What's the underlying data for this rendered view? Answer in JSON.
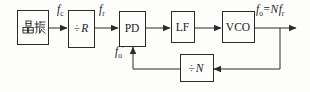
{
  "colors": {
    "background": "#fdfdfc",
    "line": "#2b2b2b",
    "text": "#1c1c1c"
  },
  "blocks": {
    "crystal": {
      "label": "晶振"
    },
    "divider_r": {
      "sign": "÷",
      "variable": "R"
    },
    "phase_detector": {
      "label": "PD"
    },
    "loop_filter": {
      "label": "LF"
    },
    "vco": {
      "label": "VCO"
    },
    "divider_n": {
      "sign": "÷",
      "variable": "N"
    }
  },
  "signals": {
    "crystal_out": {
      "base": "f",
      "sub": "c"
    },
    "reference": {
      "base": "f",
      "sub": "r"
    },
    "output": {
      "f1": "f",
      "sub1": "o",
      "eq": "=",
      "coef": "N",
      "f2": "f",
      "sub2": "r"
    },
    "feedback": {
      "base": "f",
      "sub": "o",
      "prime": "′"
    }
  }
}
